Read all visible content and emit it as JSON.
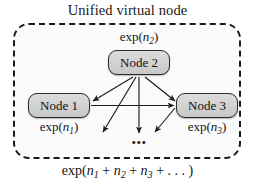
{
  "diagram": {
    "title": "Unified virtual node",
    "container": {
      "name": "unified-virtual-node-boundary",
      "style": "dashed-rounded-rectangle",
      "border_color": "#1a1a1a",
      "fill_color": "#fbfbfb"
    },
    "nodes": [
      {
        "id": "node-1",
        "label": "Node 1",
        "exp_label": "exp(n₁)",
        "x": 59,
        "y": 105
      },
      {
        "id": "node-2",
        "label": "Node 2",
        "exp_label": "exp(n₂)",
        "x": 139,
        "y": 62
      },
      {
        "id": "node-3",
        "label": "Node 3",
        "exp_label": "exp(n₃)",
        "x": 207,
        "y": 105
      }
    ],
    "node_fill_color": "#d2d2d2",
    "node_border_color": "#2b2b2b",
    "ellipsis": "•••",
    "total_label": "exp(n₁ + n₂ + n₃ + ...)",
    "edges": [
      {
        "name": "edge-node2-to-node1",
        "from": "node-2",
        "to": "node-1",
        "arrowhead": true
      },
      {
        "name": "edge-node2-to-node3",
        "from": "node-2",
        "to": "node-3",
        "arrowhead": true
      },
      {
        "name": "edge-node1-to-node3",
        "from": "node-1",
        "to": "node-3",
        "arrowhead": true
      },
      {
        "name": "edge-node2-down-left",
        "from": "node-2",
        "to": "unlabeled",
        "arrowhead": true
      },
      {
        "name": "edge-node2-down-center",
        "from": "node-2",
        "to": "unlabeled",
        "arrowhead": true
      },
      {
        "name": "edge-node2-down-right",
        "from": "node-2",
        "to": "unlabeled",
        "arrowhead": true
      }
    ]
  }
}
